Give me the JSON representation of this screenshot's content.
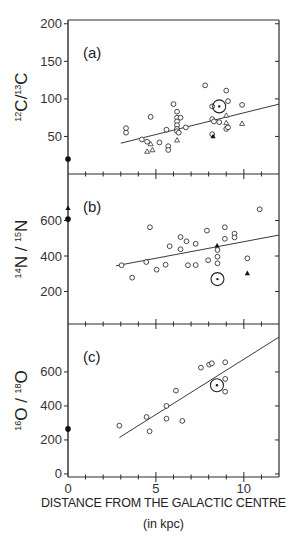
{
  "chart_data": [
    {
      "panel": "(a)",
      "type": "scatter",
      "ylabel": "12C/13C",
      "ylabel_parts": {
        "sup1": "12",
        "base1": "C/",
        "sup2": "13",
        "base2": "C"
      },
      "yticks": [
        50,
        100,
        150,
        200
      ],
      "ylim": [
        0,
        205
      ],
      "xlim": [
        0,
        12
      ],
      "series": [
        {
          "name": "open circles",
          "marker": "open-circle",
          "points": [
            [
              3.3,
              61
            ],
            [
              3.3,
              55
            ],
            [
              4.7,
              76
            ],
            [
              4.2,
              46
            ],
            [
              4.5,
              43
            ],
            [
              5.2,
              42
            ],
            [
              5.6,
              59
            ],
            [
              5.7,
              37
            ],
            [
              5.7,
              32
            ],
            [
              6.0,
              93
            ],
            [
              6.2,
              83
            ],
            [
              6.2,
              75
            ],
            [
              6.2,
              70
            ],
            [
              6.2,
              65
            ],
            [
              6.2,
              60
            ],
            [
              6.2,
              57
            ],
            [
              6.3,
              55
            ],
            [
              6.7,
              62
            ],
            [
              6.4,
              75
            ],
            [
              7.8,
              118
            ],
            [
              8.2,
              73
            ],
            [
              8.3,
              70
            ],
            [
              8.6,
              69
            ],
            [
              8.2,
              90
            ],
            [
              9.0,
              111
            ],
            [
              9.1,
              97
            ],
            [
              9.0,
              60
            ],
            [
              9.1,
              62
            ],
            [
              9.9,
              92
            ],
            [
              8.2,
              53
            ]
          ]
        },
        {
          "name": "open triangles",
          "marker": "open-triangle",
          "points": [
            [
              4.5,
              30
            ],
            [
              4.8,
              32
            ],
            [
              4.7,
              40
            ],
            [
              6.2,
              45
            ],
            [
              9.0,
              78
            ],
            [
              9.0,
              68
            ],
            [
              9.9,
              67
            ]
          ]
        },
        {
          "name": "filled triangles",
          "marker": "filled-triangle",
          "points": [
            [
              8.25,
              50
            ]
          ]
        },
        {
          "name": "sun",
          "marker": "circled-dot",
          "points": [
            [
              8.6,
              90
            ]
          ]
        },
        {
          "name": "galactic centre",
          "marker": "filled-circle",
          "points": [
            [
              0,
              20
            ]
          ]
        }
      ],
      "fit_line": [
        [
          3.0,
          41
        ],
        [
          12.0,
          93
        ]
      ]
    },
    {
      "panel": "(b)",
      "type": "scatter",
      "ylabel": "14N / 15N",
      "ylabel_parts": {
        "sup1": "14",
        "base1": "N / ",
        "sup2": "15",
        "base2": "N"
      },
      "yticks": [
        200,
        400,
        600
      ],
      "ylim": [
        17,
        862
      ],
      "xlim": [
        0,
        12
      ],
      "series": [
        {
          "name": "open circles",
          "marker": "open-circle",
          "points": [
            [
              3.05,
              348
            ],
            [
              3.65,
              278
            ],
            [
              4.45,
              366
            ],
            [
              4.66,
              562
            ],
            [
              5.04,
              323
            ],
            [
              5.55,
              351
            ],
            [
              5.78,
              455
            ],
            [
              6.4,
              507
            ],
            [
              6.4,
              438
            ],
            [
              6.74,
              483
            ],
            [
              6.82,
              348
            ],
            [
              7.26,
              469
            ],
            [
              7.26,
              349
            ],
            [
              7.9,
              543
            ],
            [
              7.97,
              376
            ],
            [
              8.5,
              434
            ],
            [
              8.5,
              396
            ],
            [
              8.5,
              359
            ],
            [
              8.92,
              562
            ],
            [
              8.92,
              497
            ],
            [
              9.47,
              526
            ],
            [
              9.47,
              505
            ],
            [
              10.2,
              387
            ],
            [
              10.9,
              663
            ]
          ]
        },
        {
          "name": "filled triangles",
          "marker": "filled-triangle",
          "points": [
            [
              8.48,
              458
            ],
            [
              10.2,
              302
            ]
          ]
        },
        {
          "name": "sun",
          "marker": "circled-dot",
          "points": [
            [
              8.5,
              270
            ]
          ]
        },
        {
          "name": "galactic centre",
          "marker": "filled-circle",
          "points": [
            [
              0,
              608
            ]
          ]
        },
        {
          "name": "galactic centre triangle",
          "marker": "filled-triangle",
          "points": [
            [
              0,
              670
            ]
          ]
        }
      ],
      "fit_line": [
        [
          2.73,
          345
        ],
        [
          12.0,
          518
        ]
      ]
    },
    {
      "panel": "(c)",
      "type": "scatter",
      "ylabel": "16O / 18O",
      "ylabel_parts": {
        "sup1": "16",
        "base1": "O / ",
        "sup2": "18",
        "base2": "O"
      },
      "yticks": [
        0,
        200,
        400,
        600
      ],
      "ylim": [
        -18,
        882
      ],
      "xlim": [
        0,
        12
      ],
      "xticks": [
        0,
        5,
        10
      ],
      "series": [
        {
          "name": "open circles",
          "marker": "open-circle",
          "points": [
            [
              2.92,
              284
            ],
            [
              4.47,
              335
            ],
            [
              4.64,
              251
            ],
            [
              5.6,
              400
            ],
            [
              5.6,
              325
            ],
            [
              6.14,
              490
            ],
            [
              6.5,
              312
            ],
            [
              7.56,
              625
            ],
            [
              8.03,
              643
            ],
            [
              8.18,
              651
            ],
            [
              8.94,
              657
            ],
            [
              8.94,
              559
            ],
            [
              8.94,
              484
            ]
          ]
        },
        {
          "name": "sun",
          "marker": "circled-dot",
          "points": [
            [
              8.47,
              522
            ]
          ]
        },
        {
          "name": "galactic centre",
          "marker": "filled-circle",
          "points": [
            [
              0,
              265
            ]
          ]
        }
      ],
      "fit_line": [
        [
          2.92,
          214
        ],
        [
          12.0,
          805
        ]
      ]
    }
  ],
  "xaxis": {
    "title": "DISTANCE FROM THE GALACTIC CENTRE",
    "units": "(in kpc)",
    "tick_labels": [
      "0",
      "5",
      "10"
    ]
  },
  "panels": {
    "a": {
      "label": "(a)"
    },
    "b": {
      "label": "(b)"
    },
    "c": {
      "label": "(c)"
    }
  }
}
